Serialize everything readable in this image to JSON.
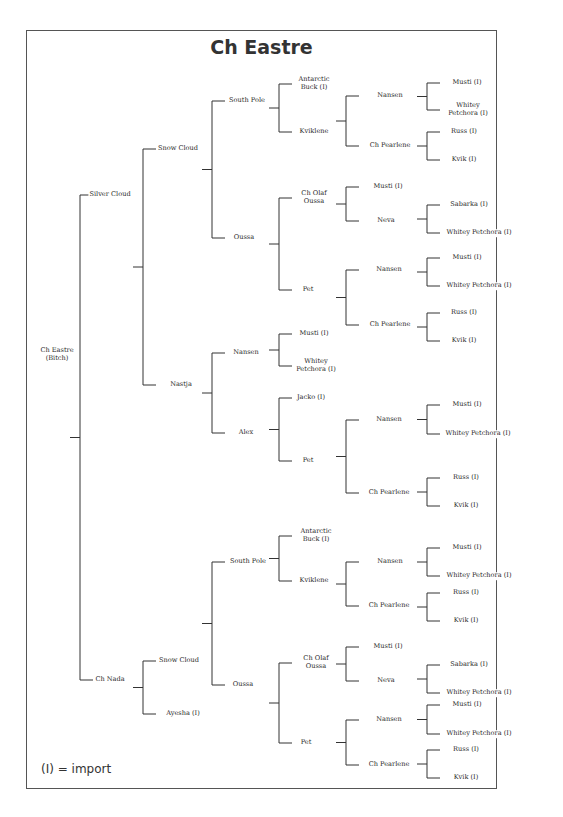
{
  "title": "Ch Eastre",
  "legend": "(I) = import",
  "nodes": [
    {
      "id": "root",
      "label": "Ch Eastre\n(Bitch)",
      "x": 57,
      "y": 355
    },
    {
      "id": "g1a",
      "label": "Silver Cloud",
      "x": 110,
      "y": 195
    },
    {
      "id": "g1b",
      "label": "Ch Nada",
      "x": 110,
      "y": 680
    },
    {
      "id": "g2a",
      "label": "Snow  Cloud",
      "x": 178,
      "y": 149
    },
    {
      "id": "g2b",
      "label": "Nastja",
      "x": 181,
      "y": 385
    },
    {
      "id": "g2c",
      "label": "Snow Cloud",
      "x": 179,
      "y": 661
    },
    {
      "id": "g2d",
      "label": "Ayesha (I)",
      "x": 183,
      "y": 714
    },
    {
      "id": "g3a",
      "label": "South Pole",
      "x": 247,
      "y": 101
    },
    {
      "id": "g3b",
      "label": "Oussa",
      "x": 244,
      "y": 238
    },
    {
      "id": "g3c",
      "label": "Nansen",
      "x": 246,
      "y": 353
    },
    {
      "id": "g3d",
      "label": "Alex",
      "x": 246,
      "y": 433
    },
    {
      "id": "g3e",
      "label": "South Pole",
      "x": 248,
      "y": 562
    },
    {
      "id": "g3f",
      "label": "Oussa",
      "x": 243,
      "y": 685
    },
    {
      "id": "g4a",
      "label": "Antarctic\nBuck (I)",
      "x": 314,
      "y": 84
    },
    {
      "id": "g4b",
      "label": "Kviklene",
      "x": 314,
      "y": 132
    },
    {
      "id": "g4c",
      "label": "Ch Olaf\nOussa",
      "x": 314,
      "y": 198
    },
    {
      "id": "g4d",
      "label": "Pet",
      "x": 308,
      "y": 290
    },
    {
      "id": "g4e",
      "label": "Musti (I)",
      "x": 314,
      "y": 334
    },
    {
      "id": "g4f",
      "label": "Whitey\nPetchora (I)",
      "x": 316,
      "y": 366
    },
    {
      "id": "g4g",
      "label": "Jacko (I)",
      "x": 311,
      "y": 398
    },
    {
      "id": "g4h",
      "label": "Pet",
      "x": 308,
      "y": 461
    },
    {
      "id": "g4i",
      "label": "Antarctic\nBuck (I)",
      "x": 316,
      "y": 536
    },
    {
      "id": "g4j",
      "label": "Kviklene",
      "x": 314,
      "y": 581
    },
    {
      "id": "g4k",
      "label": "Ch Olaf\nOussa",
      "x": 316,
      "y": 663
    },
    {
      "id": "g4l",
      "label": "Pet",
      "x": 306,
      "y": 743
    },
    {
      "id": "g5a",
      "label": "Nansen",
      "x": 390,
      "y": 96
    },
    {
      "id": "g5b",
      "label": "Ch Pearlene",
      "x": 390,
      "y": 146
    },
    {
      "id": "g5c",
      "label": "Musti (I)",
      "x": 388,
      "y": 187
    },
    {
      "id": "g5d",
      "label": "Neva",
      "x": 386,
      "y": 221
    },
    {
      "id": "g5e",
      "label": "Nansen",
      "x": 389,
      "y": 270
    },
    {
      "id": "g5f",
      "label": "Ch Pearlene",
      "x": 390,
      "y": 325
    },
    {
      "id": "g5g",
      "label": "Nansen",
      "x": 389,
      "y": 420
    },
    {
      "id": "g5h",
      "label": "Ch Pearlene",
      "x": 389,
      "y": 493
    },
    {
      "id": "g5i",
      "label": "Nansen",
      "x": 390,
      "y": 562
    },
    {
      "id": "g5j",
      "label": "Ch Pearlene",
      "x": 389,
      "y": 606
    },
    {
      "id": "g5k",
      "label": "Musti (I)",
      "x": 388,
      "y": 647
    },
    {
      "id": "g5l",
      "label": "Neva",
      "x": 386,
      "y": 681
    },
    {
      "id": "g5m",
      "label": "Nansen",
      "x": 389,
      "y": 720
    },
    {
      "id": "g5n",
      "label": "Ch Pearlene",
      "x": 389,
      "y": 765
    },
    {
      "id": "g6a",
      "label": "Musti (I)",
      "x": 467,
      "y": 83
    },
    {
      "id": "g6b",
      "label": "Whitey\nPetchora (I)",
      "x": 468,
      "y": 110
    },
    {
      "id": "g6c",
      "label": "Russ (I)",
      "x": 464,
      "y": 132
    },
    {
      "id": "g6d",
      "label": "Kvik (I)",
      "x": 464,
      "y": 160
    },
    {
      "id": "g6e",
      "label": "Sabarka (I)",
      "x": 469,
      "y": 205
    },
    {
      "id": "g6f",
      "label": "Whitey Petchora (I)",
      "x": 479,
      "y": 233
    },
    {
      "id": "g6g",
      "label": "Musti (I)",
      "x": 467,
      "y": 258
    },
    {
      "id": "g6h",
      "label": "Whitey Petchora (I)",
      "x": 479,
      "y": 286
    },
    {
      "id": "g6i",
      "label": "Russ (I)",
      "x": 464,
      "y": 313
    },
    {
      "id": "g6j",
      "label": "Kvik (I)",
      "x": 464,
      "y": 341
    },
    {
      "id": "g6k",
      "label": "Musti (I)",
      "x": 467,
      "y": 405
    },
    {
      "id": "g6l",
      "label": "Whitey Petchora (I)",
      "x": 478,
      "y": 434
    },
    {
      "id": "g6m",
      "label": "Russ (I)",
      "x": 466,
      "y": 478
    },
    {
      "id": "g6n",
      "label": "Kvik (I)",
      "x": 466,
      "y": 506
    },
    {
      "id": "g6o",
      "label": "Musti (I)",
      "x": 467,
      "y": 548
    },
    {
      "id": "g6p",
      "label": "Whitey Petchora (I)",
      "x": 479,
      "y": 576
    },
    {
      "id": "g6q",
      "label": "Russ (I)",
      "x": 466,
      "y": 593
    },
    {
      "id": "g6r",
      "label": "Kvik (I)",
      "x": 466,
      "y": 621
    },
    {
      "id": "g6s",
      "label": "Sabarka (I)",
      "x": 469,
      "y": 665
    },
    {
      "id": "g6t",
      "label": "Whitey Petchora (I)",
      "x": 479,
      "y": 693
    },
    {
      "id": "g6u",
      "label": "Musti (I)",
      "x": 467,
      "y": 705
    },
    {
      "id": "g6v",
      "label": "Whitey Petchora (I)",
      "x": 479,
      "y": 734
    },
    {
      "id": "g6w",
      "label": "Russ (I)",
      "x": 466,
      "y": 750
    },
    {
      "id": "g6x",
      "label": "Kvik (I)",
      "x": 466,
      "y": 778
    }
  ],
  "brackets": [
    {
      "x": 27,
      "y1": 195,
      "y2": 680,
      "from": "root"
    },
    {
      "x": 80,
      "y1": 195,
      "y2": 680,
      "from": "root"
    },
    {
      "x": 143,
      "y1": 149,
      "y2": 385
    },
    {
      "x": 143,
      "y1": 661,
      "y2": 714
    },
    {
      "x": 212,
      "y1": 101,
      "y2": 238
    },
    {
      "x": 212,
      "y1": 353,
      "y2": 433
    },
    {
      "x": 212,
      "y1": 562,
      "y2": 685
    },
    {
      "x": 279,
      "y1": 84,
      "y2": 132
    },
    {
      "x": 279,
      "y1": 198,
      "y2": 290
    },
    {
      "x": 279,
      "y1": 334,
      "y2": 366
    },
    {
      "x": 279,
      "y1": 398,
      "y2": 461
    },
    {
      "x": 279,
      "y1": 536,
      "y2": 581
    },
    {
      "x": 279,
      "y1": 663,
      "y2": 743
    },
    {
      "x": 346,
      "y1": 96,
      "y2": 146
    },
    {
      "x": 346,
      "y1": 187,
      "y2": 221
    },
    {
      "x": 346,
      "y1": 270,
      "y2": 325
    },
    {
      "x": 346,
      "y1": 420,
      "y2": 493
    },
    {
      "x": 346,
      "y1": 562,
      "y2": 606
    },
    {
      "x": 346,
      "y1": 647,
      "y2": 681
    },
    {
      "x": 346,
      "y1": 720,
      "y2": 765
    },
    {
      "x": 427,
      "y1": 83,
      "y2": 110
    },
    {
      "x": 427,
      "y1": 132,
      "y2": 160
    },
    {
      "x": 427,
      "y1": 205,
      "y2": 233
    },
    {
      "x": 427,
      "y1": 258,
      "y2": 286
    },
    {
      "x": 427,
      "y1": 313,
      "y2": 341
    },
    {
      "x": 427,
      "y1": 405,
      "y2": 434
    },
    {
      "x": 427,
      "y1": 478,
      "y2": 506
    },
    {
      "x": 427,
      "y1": 548,
      "y2": 576
    },
    {
      "x": 427,
      "y1": 593,
      "y2": 621
    },
    {
      "x": 427,
      "y1": 665,
      "y2": 693
    },
    {
      "x": 427,
      "y1": 705,
      "y2": 734
    },
    {
      "x": 427,
      "y1": 750,
      "y2": 778
    }
  ]
}
